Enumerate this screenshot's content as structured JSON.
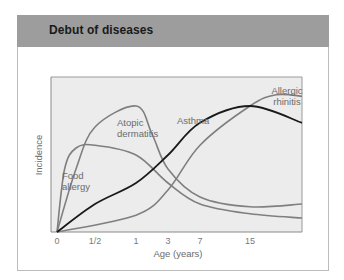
{
  "header": {
    "title": "Debut of diseases"
  },
  "colors": {
    "header_bg": "#9d9d9d",
    "plot_bg": "#ececec",
    "grey_curve": "#7f7f7f",
    "asthma_curve": "#1a1a1a"
  },
  "chart_data": {
    "type": "line",
    "title": "Debut of diseases",
    "xlabel": "Age (years)",
    "ylabel": "Incidence",
    "x_ticks": [
      "0",
      "1/2",
      "1",
      "3",
      "7",
      "15"
    ],
    "x_tick_positions": [
      0,
      0.5,
      1,
      3,
      7,
      15
    ],
    "x_scale": "nonlinear (compressed)",
    "y_ticks": [],
    "ylim": [
      0,
      1
    ],
    "grid": false,
    "legend": "none (inline curve labels)",
    "series": [
      {
        "name": "Food allergy",
        "label": "Food\nallergy",
        "color": "#7f7f7f",
        "points": [
          [
            0,
            0
          ],
          [
            0.1,
            0.45
          ],
          [
            0.25,
            0.6
          ],
          [
            0.5,
            0.62
          ],
          [
            1,
            0.55
          ],
          [
            3,
            0.35
          ],
          [
            7,
            0.2
          ],
          [
            15,
            0.13
          ],
          [
            25,
            0.1
          ]
        ]
      },
      {
        "name": "Atopic dermatitis",
        "label": "Atopic\ndermatitis",
        "color": "#7f7f7f",
        "points": [
          [
            0,
            0
          ],
          [
            0.25,
            0.45
          ],
          [
            0.5,
            0.75
          ],
          [
            1,
            0.9
          ],
          [
            2,
            0.7
          ],
          [
            3,
            0.45
          ],
          [
            7,
            0.25
          ],
          [
            15,
            0.18
          ],
          [
            25,
            0.2
          ]
        ]
      },
      {
        "name": "Asthma",
        "label": "Asthma",
        "color": "#1a1a1a",
        "points": [
          [
            0,
            0
          ],
          [
            0.5,
            0.2
          ],
          [
            1,
            0.35
          ],
          [
            3,
            0.55
          ],
          [
            7,
            0.78
          ],
          [
            15,
            0.9
          ],
          [
            25,
            0.78
          ]
        ]
      },
      {
        "name": "Allergic rhinitis",
        "label": "Allergic\nrhinitis",
        "color": "#7f7f7f",
        "points": [
          [
            0,
            0
          ],
          [
            1,
            0.12
          ],
          [
            3,
            0.3
          ],
          [
            7,
            0.62
          ],
          [
            15,
            0.9
          ],
          [
            20,
            0.98
          ],
          [
            25,
            0.97
          ]
        ]
      }
    ]
  }
}
